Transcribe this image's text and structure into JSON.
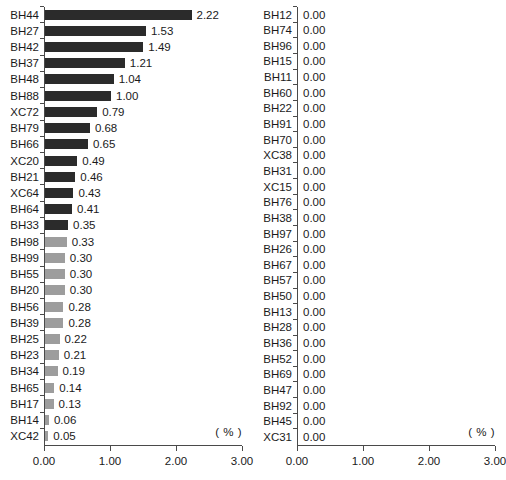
{
  "chart_data": [
    {
      "type": "bar",
      "orientation": "horizontal",
      "panel": "left",
      "title": "",
      "xlabel": "( % )",
      "ylabel": "",
      "xlim": [
        0.0,
        3.0
      ],
      "xticks": [
        0.0,
        1.0,
        2.0,
        3.0
      ],
      "xtick_labels": [
        "0.00",
        "1.00",
        "2.00",
        "3.00"
      ],
      "grid": false,
      "unit_label": "( % )",
      "value_format": "0.00",
      "categories": [
        "BH44",
        "BH27",
        "BH42",
        "BH37",
        "BH48",
        "BH88",
        "XC72",
        "BH79",
        "BH66",
        "XC20",
        "BH21",
        "XC64",
        "BH64",
        "BH33",
        "BH98",
        "BH99",
        "BH55",
        "BH20",
        "BH56",
        "BH39",
        "BH25",
        "BH23",
        "BH34",
        "BH65",
        "BH17",
        "BH14",
        "XC42"
      ],
      "values": [
        2.22,
        1.53,
        1.49,
        1.21,
        1.04,
        1.0,
        0.79,
        0.68,
        0.65,
        0.49,
        0.46,
        0.43,
        0.41,
        0.35,
        0.33,
        0.3,
        0.3,
        0.3,
        0.28,
        0.28,
        0.22,
        0.21,
        0.19,
        0.14,
        0.13,
        0.06,
        0.05
      ],
      "value_labels": [
        "2.22",
        "1.53",
        "1.49",
        "1.21",
        "1.04",
        "1.00",
        "0.79",
        "0.68",
        "0.65",
        "0.49",
        "0.46",
        "0.43",
        "0.41",
        "0.35",
        "0.33",
        "0.30",
        "0.30",
        "0.30",
        "0.28",
        "0.28",
        "0.22",
        "0.21",
        "0.19",
        "0.14",
        "0.13",
        "0.06",
        "0.05"
      ],
      "bar_colors": [
        "dark",
        "dark",
        "dark",
        "dark",
        "dark",
        "dark",
        "dark",
        "dark",
        "dark",
        "dark",
        "dark",
        "dark",
        "dark",
        "dark",
        "gray",
        "gray",
        "gray",
        "gray",
        "gray",
        "gray",
        "gray",
        "gray",
        "gray",
        "gray",
        "gray",
        "gray",
        "gray"
      ]
    },
    {
      "type": "bar",
      "orientation": "horizontal",
      "panel": "right",
      "title": "",
      "xlabel": "( % )",
      "ylabel": "",
      "xlim": [
        0.0,
        3.0
      ],
      "xticks": [
        0.0,
        1.0,
        2.0,
        3.0
      ],
      "xtick_labels": [
        "0.00",
        "1.00",
        "2.00",
        "3.00"
      ],
      "grid": false,
      "unit_label": "( % )",
      "value_format": "0.00",
      "categories": [
        "BH12",
        "BH74",
        "BH96",
        "BH15",
        "BH11",
        "BH60",
        "BH22",
        "BH91",
        "BH70",
        "XC38",
        "BH31",
        "XC15",
        "BH76",
        "BH38",
        "BH97",
        "BH26",
        "BH67",
        "BH57",
        "BH50",
        "BH13",
        "BH28",
        "BH36",
        "BH52",
        "BH69",
        "BH47",
        "BH92",
        "BH45",
        "XC31"
      ],
      "values": [
        0.0,
        0.0,
        0.0,
        0.0,
        0.0,
        0.0,
        0.0,
        0.0,
        0.0,
        0.0,
        0.0,
        0.0,
        0.0,
        0.0,
        0.0,
        0.0,
        0.0,
        0.0,
        0.0,
        0.0,
        0.0,
        0.0,
        0.0,
        0.0,
        0.0,
        0.0,
        0.0,
        0.0
      ],
      "value_labels": [
        "0.00",
        "0.00",
        "0.00",
        "0.00",
        "0.00",
        "0.00",
        "0.00",
        "0.00",
        "0.00",
        "0.00",
        "0.00",
        "0.00",
        "0.00",
        "0.00",
        "0.00",
        "0.00",
        "0.00",
        "0.00",
        "0.00",
        "0.00",
        "0.00",
        "0.00",
        "0.00",
        "0.00",
        "0.00",
        "0.00",
        "0.00",
        "0.00"
      ],
      "bar_colors": [
        "gray",
        "gray",
        "gray",
        "gray",
        "gray",
        "gray",
        "gray",
        "gray",
        "gray",
        "gray",
        "gray",
        "gray",
        "gray",
        "gray",
        "gray",
        "gray",
        "gray",
        "gray",
        "gray",
        "gray",
        "gray",
        "gray",
        "gray",
        "gray",
        "gray",
        "gray",
        "gray",
        "gray"
      ]
    }
  ],
  "colors": {
    "bar_dark": "#2b2b2b",
    "bar_gray": "#9d9d9d",
    "axis": "#4a4a4a",
    "text": "#1a1a1a",
    "background": "#ffffff"
  },
  "caption": ""
}
